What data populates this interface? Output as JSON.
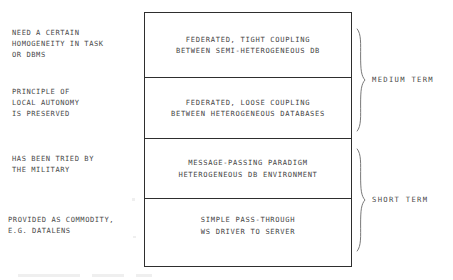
{
  "diagram": {
    "left_notes": [
      {
        "name": "note-homogeneity",
        "lines": [
          "NEED A CERTAIN",
          "HOMOGENEITY IN TASK",
          "OR DBMS"
        ]
      },
      {
        "name": "note-local-autonomy",
        "lines": [
          "PRINCIPLE OF",
          "LOCAL AUTONOMY",
          "IS PRESERVED"
        ]
      },
      {
        "name": "note-military",
        "lines": [
          "HAS BEEN TRIED BY",
          "THE MILITARY"
        ]
      },
      {
        "name": "note-commodity",
        "lines": [
          "PROVIDED AS COMMODITY,",
          "E.G. DATALENS"
        ]
      }
    ],
    "rows": [
      {
        "name": "row-federated-tight-coupling",
        "lines": [
          "FEDERATED, TIGHT COUPLING",
          "BETWEEN SEMI-HETEROGENEOUS DB"
        ]
      },
      {
        "name": "row-federated-loose-coupling",
        "lines": [
          "FEDERATED, LOOSE COUPLING",
          "BETWEEN HETEROGENEOUS DATABASES"
        ]
      },
      {
        "name": "row-message-passing",
        "lines": [
          "MESSAGE-PASSING PARADIGM",
          "HETEROGENEOUS DB  ENVIRONMENT"
        ]
      },
      {
        "name": "row-simple-pass-through",
        "lines": [
          "SIMPLE PASS-THROUGH",
          "WS DRIVER TO SERVER"
        ]
      }
    ],
    "term_groups": [
      {
        "name": "group-medium-term",
        "label": "MEDIUM TERM"
      },
      {
        "name": "group-short-term",
        "label": "SHORT TERM"
      }
    ],
    "colors": {
      "ink": "#2e2e2e",
      "text": "#454545",
      "background": "#ffffff"
    }
  }
}
